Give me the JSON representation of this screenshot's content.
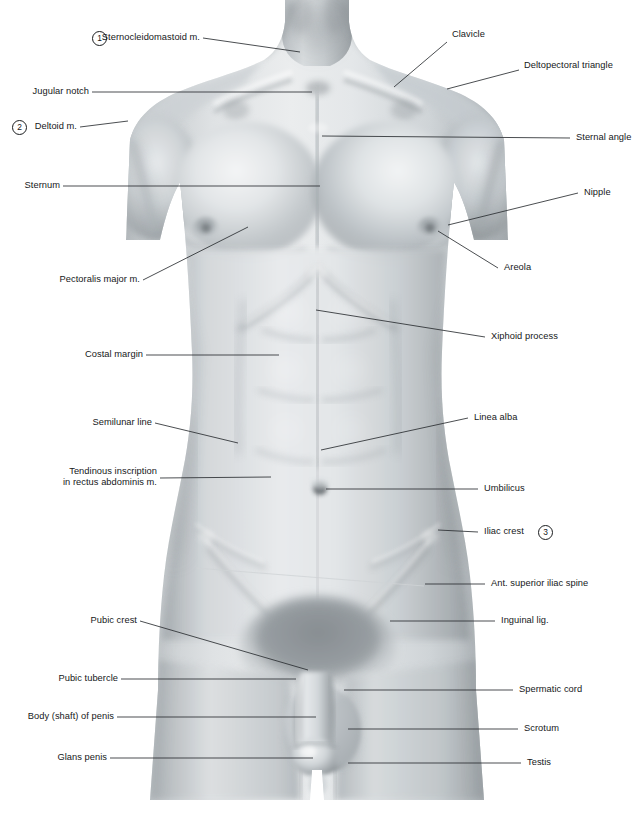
{
  "plate": {
    "title": "Anterior Trunk — Surface Anatomy",
    "view": "Anterior view of male trunk",
    "background_color": "#ffffff",
    "leader_color": "#2b2e31",
    "text_color": "#16181a",
    "width": 634,
    "height": 816
  },
  "markers": [
    {
      "id": "m1",
      "number": "1",
      "for": "Sternocleidomastoid m."
    },
    {
      "id": "m2",
      "number": "2",
      "for": "Deltoid m."
    },
    {
      "id": "m3",
      "number": "3",
      "for": "Iliac crest"
    }
  ],
  "labels_left": [
    {
      "id": "sternocleidomastoid",
      "text": "Sternocleidomastoid m.",
      "marker": "1"
    },
    {
      "id": "jugular-notch",
      "text": "Jugular notch",
      "marker": null
    },
    {
      "id": "deltoid",
      "text": "Deltoid m.",
      "marker": "2"
    },
    {
      "id": "sternum",
      "text": "Sternum",
      "marker": null
    },
    {
      "id": "pectoralis-major",
      "text": "Pectoralis major m.",
      "marker": null
    },
    {
      "id": "costal-margin",
      "text": "Costal margin",
      "marker": null
    },
    {
      "id": "semilunar-line",
      "text": "Semilunar line",
      "marker": null
    },
    {
      "id": "tendinous-inscription",
      "text": "Tendinous inscription",
      "text_line2": "in rectus abdominis m.",
      "marker": null
    },
    {
      "id": "pubic-crest",
      "text": "Pubic crest",
      "marker": null
    },
    {
      "id": "pubic-tubercle",
      "text": "Pubic tubercle",
      "marker": null
    },
    {
      "id": "body-of-penis",
      "text": "Body (shaft) of penis",
      "marker": null
    },
    {
      "id": "glans-penis",
      "text": "Glans penis",
      "marker": null
    }
  ],
  "labels_right": [
    {
      "id": "clavicle",
      "text": "Clavicle",
      "marker": null
    },
    {
      "id": "deltopectoral-triangle",
      "text": "Deltopectoral triangle",
      "marker": null
    },
    {
      "id": "sternal-angle",
      "text": "Sternal angle",
      "marker": null
    },
    {
      "id": "nipple",
      "text": "Nipple",
      "marker": null
    },
    {
      "id": "areola",
      "text": "Areola",
      "marker": null
    },
    {
      "id": "xiphoid-process",
      "text": "Xiphoid process",
      "marker": null
    },
    {
      "id": "linea-alba",
      "text": "Linea alba",
      "marker": null
    },
    {
      "id": "umbilicus",
      "text": "Umbilicus",
      "marker": null
    },
    {
      "id": "iliac-crest",
      "text": "Iliac crest",
      "marker": "3"
    },
    {
      "id": "ant-superior-iliac-spine",
      "text": "Ant. superior iliac spine",
      "marker": null
    },
    {
      "id": "inguinal-lig",
      "text": "Inguinal lig.",
      "marker": null
    },
    {
      "id": "spermatic-cord",
      "text": "Spermatic cord",
      "marker": null
    },
    {
      "id": "scrotum",
      "text": "Scrotum",
      "marker": null
    },
    {
      "id": "testis",
      "text": "Testis",
      "marker": null
    }
  ]
}
